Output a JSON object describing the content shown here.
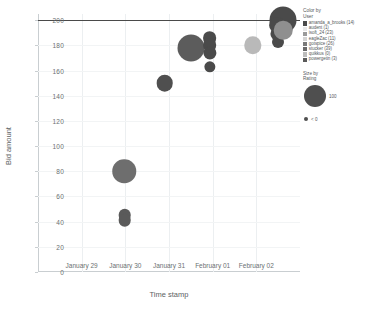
{
  "chart_data": {
    "type": "scatter",
    "title": "",
    "xlabel": "Time stamp",
    "ylabel": "Bid amount",
    "ylim": [
      0,
      205
    ],
    "yticks": [
      0,
      20,
      40,
      60,
      80,
      100,
      120,
      140,
      160,
      180,
      200
    ],
    "xticks": [
      "January 29",
      "January 30",
      "January 31",
      "February 01",
      "February 02"
    ],
    "grid": "vertical",
    "reference_line": {
      "y": 200,
      "color": "#4a4a4a"
    },
    "legend_position": "right",
    "points": [
      {
        "user": "amanda_a_brooks",
        "x": 0.98,
        "y": 80,
        "rating": 72,
        "color": "#6e6e6e"
      },
      {
        "user": "stucker",
        "x": 0.99,
        "y": 45,
        "rating": 14,
        "color": "#5a5a5a"
      },
      {
        "user": "stucker",
        "x": 0.99,
        "y": 41,
        "rating": 14,
        "color": "#5a5a5a"
      },
      {
        "user": "eagleZac",
        "x": 1.9,
        "y": 150,
        "rating": 30,
        "color": "#4f4f4f"
      },
      {
        "user": "amanda_a_brooks",
        "x": 2.5,
        "y": 178,
        "rating": 100,
        "color": "#5c5c5c"
      },
      {
        "user": "isoft_24",
        "x": 2.93,
        "y": 186,
        "rating": 18,
        "color": "#4a4a4a"
      },
      {
        "user": "isoft_24",
        "x": 2.93,
        "y": 180,
        "rating": 18,
        "color": "#4a4a4a"
      },
      {
        "user": "isoft_24",
        "x": 2.93,
        "y": 174,
        "rating": 16,
        "color": "#4a4a4a"
      },
      {
        "user": "gotspice",
        "x": 2.93,
        "y": 163,
        "rating": 10,
        "color": "#4a4a4a"
      },
      {
        "user": "quikkus",
        "x": 3.92,
        "y": 180,
        "rating": 34,
        "color": "#b9b9b9"
      },
      {
        "user": "audent",
        "x": 4.62,
        "y": 200,
        "rating": 100,
        "color": "#4a4a4a"
      },
      {
        "user": "powergetin",
        "x": 4.47,
        "y": 196,
        "rating": 26,
        "color": "#4a4a4a"
      },
      {
        "user": "powergetin",
        "x": 4.47,
        "y": 189,
        "rating": 16,
        "color": "#4a4a4a"
      },
      {
        "user": "powergetin",
        "x": 4.5,
        "y": 183,
        "rating": 12,
        "color": "#4a4a4a"
      },
      {
        "user": "gotspice",
        "x": 4.62,
        "y": 192,
        "rating": 40,
        "color": "#8f8f8f"
      }
    ]
  },
  "color_legend": {
    "title_line1": "Color by",
    "title_line2": "User",
    "items": [
      {
        "label": "amanda_a_brooks (14)",
        "color": "#4a4a4a"
      },
      {
        "label": "audent (1)",
        "color": "#e8e8e8"
      },
      {
        "label": "isoft_24 (23)",
        "color": "#9a9a9a"
      },
      {
        "label": "eagleZac (11)",
        "color": "#d4d4d4"
      },
      {
        "label": "gotspice (26)",
        "color": "#7a7a7a"
      },
      {
        "label": "stucker (39)",
        "color": "#6a6a6a"
      },
      {
        "label": "quikkus (0)",
        "color": "#bcbcbc"
      },
      {
        "label": "powergetin (3)",
        "color": "#5a5a5a"
      }
    ]
  },
  "size_legend": {
    "title_line1": "Size by",
    "title_line2": "Rating",
    "items": [
      {
        "label": "100",
        "size": 22
      },
      {
        "label": "< 0",
        "size": 4
      }
    ]
  }
}
